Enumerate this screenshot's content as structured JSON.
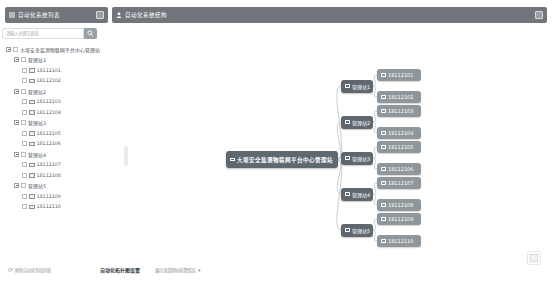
{
  "header": {
    "left_title": "自动化系统列表",
    "right_title": "自动化系统结构"
  },
  "sidebar": {
    "search_placeholder": "请输入关键字查询"
  },
  "root_label": "大坝安全监测物联网平台中心管理站",
  "stations": [
    {
      "label": "管理站1",
      "children": [
        "18112101",
        "18112102"
      ]
    },
    {
      "label": "管理站2",
      "children": [
        "18112103",
        "18112104"
      ]
    },
    {
      "label": "管理站3",
      "children": [
        "18112105",
        "18112106"
      ]
    },
    {
      "label": "管理站4",
      "children": [
        "18112107",
        "18112108"
      ]
    },
    {
      "label": "管理站5",
      "children": [
        "18112109",
        "18112110"
      ]
    }
  ],
  "footer": {
    "refresh_label": "刷新自动化系统列表",
    "refresh_icon": "⟳",
    "settings_title": "自动化拓扑图设置",
    "display_option": "展示全部测站布置情况",
    "caret_icon": "▾"
  },
  "icons": {
    "list-icon": "three-horizontal-lines",
    "user-icon": "person-silhouette",
    "search-icon": "magnifier",
    "collapse-toggle-icon": "squared-minus",
    "checkbox": "empty-square",
    "device-icon": "monitor-square",
    "expand-icon": "small-square",
    "refresh-icon": "circular-arrow",
    "caret-icon": "▾"
  },
  "colors": {
    "header_bg": "#70767b",
    "node_dark": "#5f686f",
    "node_leaf": "#8f979c",
    "connector": "#cbced1",
    "search_button": "#9aa1a6",
    "tree_text": "#4a4d50",
    "footer_text": "#9a9ea1"
  }
}
